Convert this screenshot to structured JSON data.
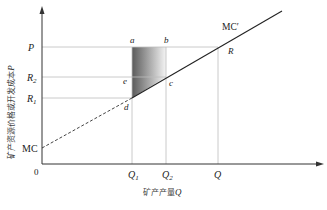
{
  "diagram": {
    "title": "",
    "y_axis": {
      "label_cjk": "矿产资源价格或开发成本",
      "label_var": "P"
    },
    "x_axis": {
      "label_cjk": "矿产产量",
      "label_var": "Q"
    },
    "origin": "0",
    "y_ticks": [
      {
        "main": "P",
        "sub": ""
      },
      {
        "main": "R",
        "sub": "2"
      },
      {
        "main": "R",
        "sub": "1"
      }
    ],
    "x_ticks": [
      {
        "main": "Q",
        "sub": "1"
      },
      {
        "main": "Q",
        "sub": "2"
      },
      {
        "main": "Q",
        "sub": ""
      }
    ],
    "curves": {
      "mc_label": "MC",
      "mc_prime_label": "MC′"
    },
    "points": {
      "a": "a",
      "b": "b",
      "c": "c",
      "d": "d",
      "e": "e",
      "R": "R"
    },
    "colors": {
      "axis": "#333333",
      "guide": "#bbbbbb",
      "shade_dark": "#555555",
      "shade_light": "#f2f2f2"
    }
  }
}
